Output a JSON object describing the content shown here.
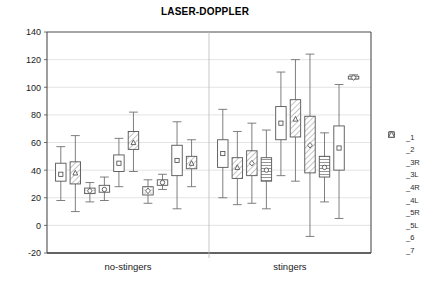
{
  "chart_data": {
    "type": "box",
    "title": "LASER-DOPPLER",
    "xlabel": "",
    "ylabel": "",
    "ylim": [
      -20,
      140
    ],
    "ytick_step": 20,
    "yticks": [
      "140",
      "120",
      "100",
      "80",
      "60",
      "40",
      "20",
      "0",
      "-20"
    ],
    "grid": "horizontal",
    "legend_position": "right",
    "group_labels": [
      "no-stingers",
      "stingers"
    ],
    "series_names": [
      "_1",
      "_2",
      "_3R",
      "_3L",
      "_4R",
      "_4L",
      "_5R",
      "_5L",
      "_6",
      "_7"
    ],
    "series_markers": [
      "square",
      "triangle",
      "diamond",
      "circle",
      "square",
      "triangle",
      "diamond",
      "circle",
      "square",
      "triangle"
    ],
    "series_fills": [
      "none",
      "hatch-right",
      "dots",
      "none",
      "none",
      "hatch-right",
      "dots",
      "hatch-right",
      "lines-h",
      "none"
    ],
    "groups": [
      {
        "name": "no-stingers",
        "boxes": [
          {
            "series": "_1",
            "whisker_low": 18,
            "q1": 32,
            "mean": 37,
            "q3": 45,
            "whisker_high": 57,
            "fill": "none",
            "marker": "square"
          },
          {
            "series": "_2",
            "whisker_low": 10,
            "q1": 30,
            "mean": 38,
            "q3": 46,
            "whisker_high": 65,
            "fill": "hatch-right",
            "marker": "triangle"
          },
          {
            "series": "_3R",
            "whisker_low": 17,
            "q1": 23,
            "mean": 25,
            "q3": 27,
            "whisker_high": 31,
            "fill": "dots",
            "marker": "diamond"
          },
          {
            "series": "_3L",
            "whisker_low": 18,
            "q1": 24,
            "mean": 26,
            "q3": 29,
            "whisker_high": 35,
            "fill": "none",
            "marker": "circle"
          },
          {
            "series": "_4R",
            "whisker_low": 28,
            "q1": 39,
            "mean": 45,
            "q3": 51,
            "whisker_high": 63,
            "fill": "none",
            "marker": "square"
          },
          {
            "series": "_4L",
            "whisker_low": 39,
            "q1": 55,
            "mean": 60,
            "q3": 68,
            "whisker_high": 82,
            "fill": "hatch-right",
            "marker": "triangle"
          },
          {
            "series": "_5R",
            "whisker_low": 16,
            "q1": 22,
            "mean": 25,
            "q3": 28,
            "whisker_high": 33,
            "fill": "dots",
            "marker": "diamond"
          },
          {
            "series": "_5L",
            "whisker_low": 26,
            "q1": 29,
            "mean": 31,
            "q3": 33,
            "whisker_high": 37,
            "fill": "none",
            "marker": "circle"
          },
          {
            "series": "_6",
            "whisker_low": 12,
            "q1": 36,
            "mean": 47,
            "q3": 58,
            "whisker_high": 75,
            "fill": "none",
            "marker": "square"
          },
          {
            "series": "_7",
            "whisker_low": 28,
            "q1": 41,
            "mean": 45,
            "q3": 50,
            "whisker_high": 62,
            "fill": "hatch-right",
            "marker": "triangle"
          }
        ]
      },
      {
        "name": "stingers",
        "boxes": [
          {
            "series": "_1",
            "whisker_low": 20,
            "q1": 42,
            "mean": 52,
            "q3": 62,
            "whisker_high": 84,
            "fill": "none",
            "marker": "square"
          },
          {
            "series": "_2",
            "whisker_low": 15,
            "q1": 34,
            "mean": 42,
            "q3": 49,
            "whisker_high": 68,
            "fill": "hatch-right",
            "marker": "triangle"
          },
          {
            "series": "_3R",
            "whisker_low": 16,
            "q1": 36,
            "mean": 45,
            "q3": 54,
            "whisker_high": 74,
            "fill": "hatch-right",
            "marker": "diamond"
          },
          {
            "series": "_3L",
            "whisker_low": 12,
            "q1": 32,
            "mean": 40,
            "q3": 49,
            "whisker_high": 69,
            "fill": "lines-h",
            "marker": "circle"
          },
          {
            "series": "_4R",
            "whisker_low": 36,
            "q1": 62,
            "mean": 74,
            "q3": 86,
            "whisker_high": 111,
            "fill": "none",
            "marker": "square"
          },
          {
            "series": "_4L",
            "whisker_low": 32,
            "q1": 64,
            "mean": 77,
            "q3": 91,
            "whisker_high": 120,
            "fill": "hatch-right",
            "marker": "triangle"
          },
          {
            "series": "_5R",
            "whisker_low": -8,
            "q1": 38,
            "mean": 58,
            "q3": 79,
            "whisker_high": 124,
            "fill": "hatch-right",
            "marker": "diamond"
          },
          {
            "series": "_5L",
            "whisker_low": 17,
            "q1": 35,
            "mean": 42,
            "q3": 50,
            "whisker_high": 67,
            "fill": "lines-h",
            "marker": "circle"
          },
          {
            "series": "_6",
            "whisker_low": 5,
            "q1": 40,
            "mean": 56,
            "q3": 72,
            "whisker_high": 102,
            "fill": "none",
            "marker": "square"
          },
          {
            "series": "_7",
            "whisker_low": 106,
            "q1": 106,
            "mean": 107,
            "q3": 108,
            "whisker_high": 109,
            "fill": "none",
            "marker": "diamond"
          }
        ]
      }
    ]
  },
  "legend": {
    "items": [
      {
        "label": "_1",
        "marker": "square"
      },
      {
        "label": "_2",
        "marker": "triangle"
      },
      {
        "label": "_3R",
        "marker": "diamond"
      },
      {
        "label": "_3L",
        "marker": "circle"
      },
      {
        "label": "_4R",
        "marker": "square"
      },
      {
        "label": "_4L",
        "marker": "triangle"
      },
      {
        "label": "_5R",
        "marker": "diamond"
      },
      {
        "label": "_5L",
        "marker": "circle"
      },
      {
        "label": "_6",
        "marker": "square"
      },
      {
        "label": "_7",
        "marker": "triangle"
      }
    ]
  },
  "colors": {
    "axis": "#4d4d4d",
    "grid": "#d9d9d9",
    "box_stroke": "#555555",
    "whisker": "#707070",
    "text": "#1a1a1a",
    "background": "#ffffff"
  }
}
